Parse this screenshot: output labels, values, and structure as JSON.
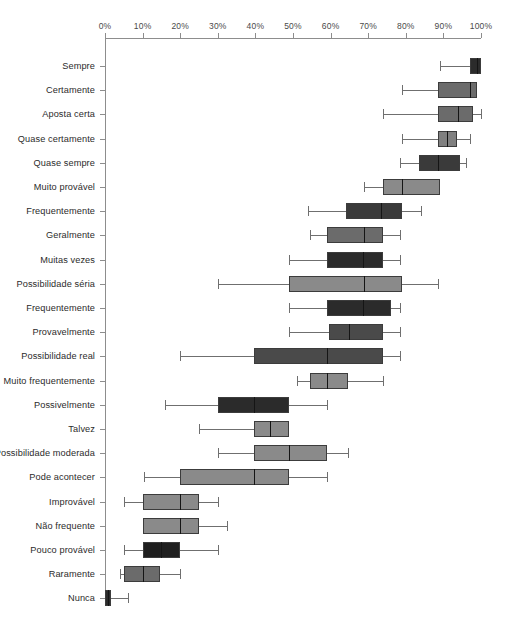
{
  "chart_data": {
    "type": "box",
    "title": "",
    "xlabel": "",
    "ylabel": "",
    "xlim": [
      0,
      100
    ],
    "grid": false,
    "legend": null,
    "x_tick_labels": [
      "0%",
      "10%",
      "20%",
      "30%",
      "40%",
      "50%",
      "60%",
      "70%",
      "80%",
      "90%",
      "100%"
    ],
    "x_tick_values": [
      0,
      10,
      20,
      30,
      40,
      50,
      60,
      70,
      80,
      90,
      100
    ],
    "categories": [
      "Sempre",
      "Certamente",
      "Aposta certa",
      "Quase certamente",
      "Quase sempre",
      "Muito provável",
      "Frequentemente",
      "Geralmente",
      "Muitas vezes",
      "Possibilidade séria",
      "Frequentemente",
      "Provavelmente",
      "Possibilidade real",
      "Muito frequentemente",
      "Possivelmente",
      "Talvez",
      "Possibilidade moderada",
      "Pode acontecer",
      "Improvável",
      "Não frequente",
      "Pouco provável",
      "Raramente",
      "Nunca"
    ],
    "boxes": [
      {
        "label": "Sempre",
        "min": 89,
        "q1": 97,
        "median": 99,
        "q3": 100,
        "max": 100,
        "color": "#2b2b2b"
      },
      {
        "label": "Certamente",
        "min": 79,
        "q1": 88.5,
        "median": 97,
        "q3": 99,
        "max": 99,
        "color": "#6b6b6b"
      },
      {
        "label": "Aposta certa",
        "min": 74,
        "q1": 88.5,
        "median": 94,
        "q3": 98,
        "max": 100,
        "color": "#6b6b6b"
      },
      {
        "label": "Quase certamente",
        "min": 79,
        "q1": 88.5,
        "median": 91,
        "q3": 93.5,
        "max": 97,
        "color": "#808080"
      },
      {
        "label": "Quase sempre",
        "min": 78.5,
        "q1": 83.5,
        "median": 88.5,
        "q3": 94.5,
        "max": 96,
        "color": "#3a3a3a"
      },
      {
        "label": "Muito provável",
        "min": 69,
        "q1": 74,
        "median": 79,
        "q3": 89,
        "max": 89,
        "color": "#8a8a8a"
      },
      {
        "label": "Frequentemente",
        "min": 54,
        "q1": 64,
        "median": 73.5,
        "q3": 79,
        "max": 84,
        "color": "#3a3a3a"
      },
      {
        "label": "Geralmente",
        "min": 54.5,
        "q1": 59,
        "median": 69,
        "q3": 74,
        "max": 78.5,
        "color": "#6b6b6b"
      },
      {
        "label": "Muitas vezes",
        "min": 49,
        "q1": 59,
        "median": 68.5,
        "q3": 74,
        "max": 78.5,
        "color": "#2b2b2b"
      },
      {
        "label": "Possibilidade séria",
        "min": 30,
        "q1": 49,
        "median": 69,
        "q3": 79,
        "max": 88.5,
        "color": "#8a8a8a"
      },
      {
        "label": "Frequentemente",
        "min": 49,
        "q1": 59,
        "median": 68.5,
        "q3": 76,
        "max": 78.5,
        "color": "#2b2b2b"
      },
      {
        "label": "Provavelmente",
        "min": 49,
        "q1": 59.5,
        "median": 65,
        "q3": 74,
        "max": 78.5,
        "color": "#4a4a4a"
      },
      {
        "label": "Possibilidade real",
        "min": 20,
        "q1": 39.5,
        "median": 59,
        "q3": 74,
        "max": 78.5,
        "color": "#4a4a4a"
      },
      {
        "label": "Muito frequentemente",
        "min": 51,
        "q1": 54.5,
        "median": 59,
        "q3": 64.5,
        "max": 74,
        "color": "#8a8a8a"
      },
      {
        "label": "Possivelmente",
        "min": 16,
        "q1": 30,
        "median": 39.5,
        "q3": 49,
        "max": 59,
        "color": "#2b2b2b"
      },
      {
        "label": "Talvez",
        "min": 25,
        "q1": 39.5,
        "median": 44,
        "q3": 49,
        "max": 49,
        "color": "#8a8a8a"
      },
      {
        "label": "Possibilidade moderada",
        "min": 30,
        "q1": 39.5,
        "median": 49,
        "q3": 59,
        "max": 64.5,
        "color": "#8a8a8a"
      },
      {
        "label": "Pode acontecer",
        "min": 10.5,
        "q1": 20,
        "median": 39.5,
        "q3": 49,
        "max": 59,
        "color": "#8a8a8a"
      },
      {
        "label": "Improvável",
        "min": 5,
        "q1": 10,
        "median": 20,
        "q3": 25,
        "max": 30,
        "color": "#8a8a8a"
      },
      {
        "label": "Não frequente",
        "min": 10,
        "q1": 10,
        "median": 20,
        "q3": 25,
        "max": 32.5,
        "color": "#8a8a8a"
      },
      {
        "label": "Pouco provável",
        "min": 5,
        "q1": 10,
        "median": 15,
        "q3": 20,
        "max": 30,
        "color": "#1f1f1f"
      },
      {
        "label": "Raramente",
        "min": 4,
        "q1": 5,
        "median": 10,
        "q3": 14.5,
        "max": 20,
        "color": "#6b6b6b"
      },
      {
        "label": "Nunca",
        "min": 0,
        "q1": 0,
        "median": 0.7,
        "q3": 1.5,
        "max": 6,
        "color": "#2b2b2b"
      }
    ]
  },
  "axis": {
    "x_start_px": 105,
    "x_end_px": 481,
    "first_row_y_px": 66,
    "row_step_px": 24.2
  }
}
